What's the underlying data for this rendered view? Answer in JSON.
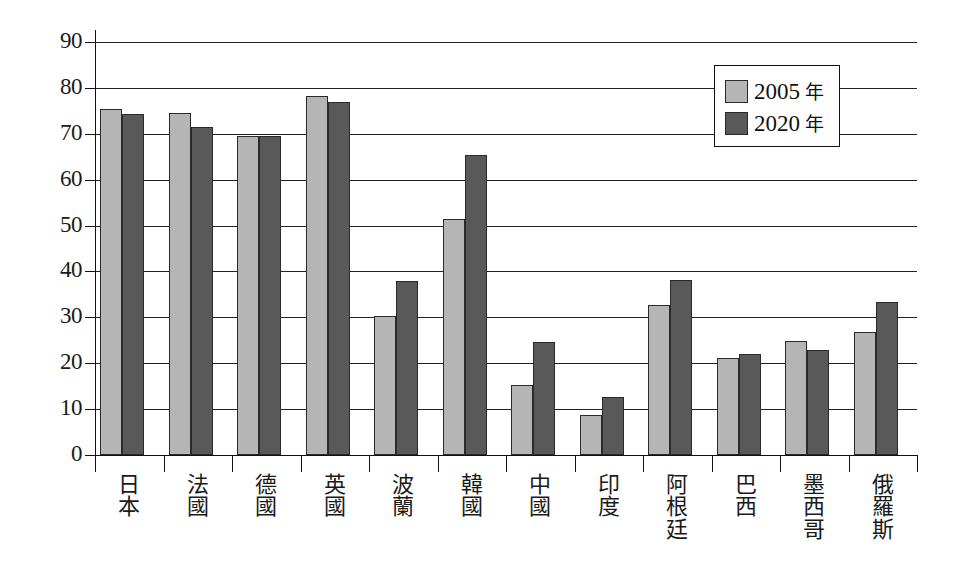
{
  "chart_data": {
    "type": "bar",
    "title": "",
    "xlabel": "",
    "ylabel": "",
    "ylim": [
      0,
      90
    ],
    "ytick_step": 10,
    "yticks": [
      0,
      10,
      20,
      30,
      40,
      50,
      60,
      70,
      80,
      90
    ],
    "grid": true,
    "legend_position": "top-right",
    "categories": [
      "日本",
      "法國",
      "德國",
      "英國",
      "波蘭",
      "韓國",
      "中國",
      "印度",
      "阿根廷",
      "巴西",
      "墨西哥",
      "俄羅斯"
    ],
    "series": [
      {
        "name": "2005 年",
        "color": "#b5b5b5",
        "values": [
          75.5,
          74.6,
          69.6,
          78.2,
          30.2,
          51.5,
          15.3,
          8.8,
          32.8,
          21.2,
          24.8,
          26.7
        ]
      },
      {
        "name": "2020 年",
        "color": "#595959",
        "values": [
          74.4,
          71.5,
          69.5,
          76.9,
          37.9,
          65.3,
          24.7,
          12.7,
          38.1,
          22.1,
          22.9,
          33.4
        ]
      }
    ]
  },
  "legend": {
    "entries": [
      {
        "year": "2005",
        "unit": "年",
        "color": "#b5b5b5"
      },
      {
        "year": "2020",
        "unit": "年",
        "color": "#595959"
      }
    ]
  },
  "axis": {
    "y_labels": [
      "90",
      "80",
      "70",
      "60",
      "50",
      "40",
      "30",
      "20",
      "10",
      "0"
    ]
  }
}
